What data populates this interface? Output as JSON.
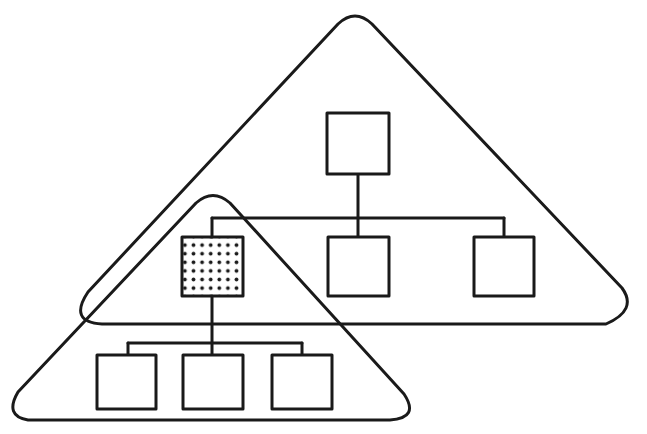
{
  "diagram": {
    "type": "hierarchy-overlap",
    "colors": {
      "stroke": "#1a1a1a",
      "background": "#ffffff",
      "shade_dot": "#1a1a1a"
    },
    "groups": [
      {
        "id": "upper-triangle",
        "label": ""
      },
      {
        "id": "lower-triangle",
        "label": ""
      }
    ],
    "nodes": [
      {
        "id": "top-root",
        "level": 0,
        "shaded": false
      },
      {
        "id": "mid-left-shaded",
        "level": 1,
        "shaded": true
      },
      {
        "id": "mid-center",
        "level": 1,
        "shaded": false
      },
      {
        "id": "mid-right",
        "level": 1,
        "shaded": false
      },
      {
        "id": "bottom-left",
        "level": 2,
        "shaded": false
      },
      {
        "id": "bottom-center",
        "level": 2,
        "shaded": false
      },
      {
        "id": "bottom-right",
        "level": 2,
        "shaded": false
      }
    ],
    "edges": [
      [
        "top-root",
        "mid-left-shaded"
      ],
      [
        "top-root",
        "mid-center"
      ],
      [
        "top-root",
        "mid-right"
      ],
      [
        "mid-left-shaded",
        "bottom-left"
      ],
      [
        "mid-left-shaded",
        "bottom-center"
      ],
      [
        "mid-left-shaded",
        "bottom-right"
      ]
    ]
  }
}
